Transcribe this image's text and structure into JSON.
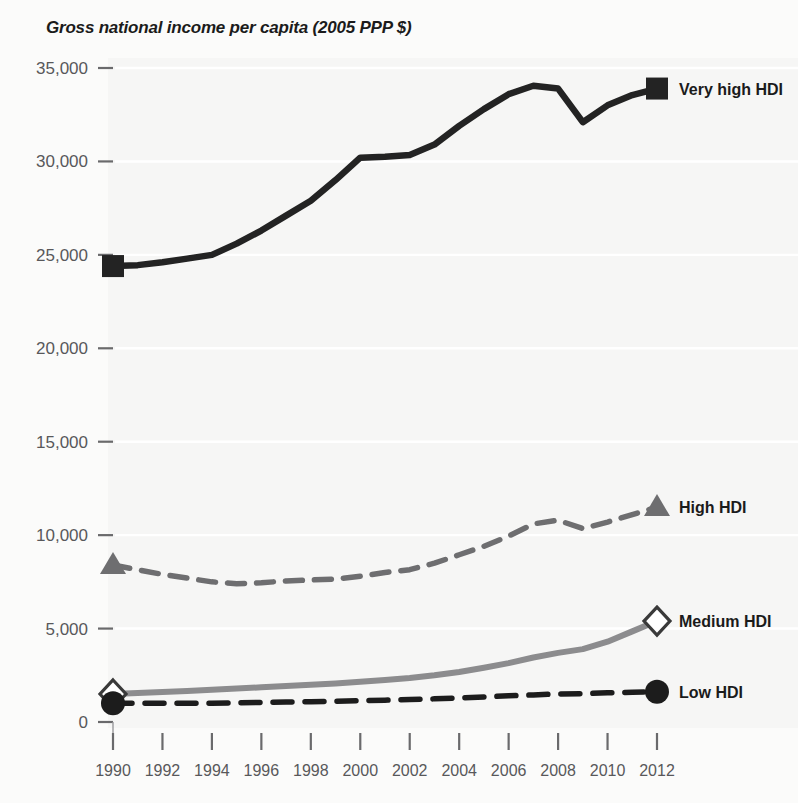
{
  "chart_data": {
    "type": "line",
    "title": "Gross national income per capita (2005 PPP $)",
    "xlabel": "",
    "ylabel": "",
    "xlim": [
      1990,
      2012
    ],
    "ylim": [
      0,
      35000
    ],
    "grid": true,
    "legend_position": "right-inline-at-series-end",
    "x": [
      1990,
      1991,
      1992,
      1993,
      1994,
      1995,
      1996,
      1997,
      1998,
      1999,
      2000,
      2001,
      2002,
      2003,
      2004,
      2005,
      2006,
      2007,
      2008,
      2009,
      2010,
      2011,
      2012
    ],
    "ytick_labels": [
      "0",
      "5,000",
      "10,000",
      "15,000",
      "20,000",
      "25,000",
      "30,000",
      "35,000"
    ],
    "ytick_values": [
      0,
      5000,
      10000,
      15000,
      20000,
      25000,
      30000,
      35000
    ],
    "xtick_labels": [
      "1990",
      "1992",
      "1994",
      "1996",
      "1998",
      "2000",
      "2002",
      "2004",
      "2006",
      "2008",
      "2010",
      "2012"
    ],
    "xtick_values": [
      1990,
      1992,
      1994,
      1996,
      1998,
      2000,
      2002,
      2004,
      2006,
      2008,
      2010,
      2012
    ],
    "series": [
      {
        "name": "Very high HDI",
        "marker": "filled-square",
        "line_style": "solid",
        "color": "#232323",
        "values": [
          24400,
          24450,
          24600,
          24800,
          25000,
          25600,
          26300,
          27100,
          27900,
          29000,
          30200,
          30250,
          30350,
          30900,
          31900,
          32800,
          33600,
          34050,
          33900,
          32100,
          33000,
          33550,
          33900
        ]
      },
      {
        "name": "High HDI",
        "marker": "filled-triangle",
        "line_style": "dashed",
        "color": "#6e6e70",
        "values": [
          8400,
          8150,
          7900,
          7700,
          7500,
          7400,
          7450,
          7550,
          7600,
          7650,
          7800,
          8000,
          8150,
          8500,
          8950,
          9400,
          9950,
          10600,
          10800,
          10350,
          10700,
          11100,
          11500
        ]
      },
      {
        "name": "Medium HDI",
        "marker": "open-diamond",
        "line_style": "solid",
        "color": "#8c8c8e",
        "values": [
          1500,
          1550,
          1600,
          1660,
          1720,
          1790,
          1860,
          1930,
          1990,
          2060,
          2150,
          2250,
          2360,
          2500,
          2680,
          2900,
          3150,
          3450,
          3700,
          3900,
          4300,
          4850,
          5400
        ]
      },
      {
        "name": "Low HDI",
        "marker": "filled-circle",
        "line_style": "dashed",
        "color": "#1c1c1c",
        "values": [
          1000,
          1000,
          1000,
          1000,
          1010,
          1030,
          1050,
          1070,
          1090,
          1110,
          1140,
          1170,
          1200,
          1240,
          1290,
          1340,
          1400,
          1450,
          1500,
          1520,
          1560,
          1590,
          1620
        ]
      }
    ]
  },
  "legend": {
    "items": [
      {
        "label": "Very high HDI"
      },
      {
        "label": "High HDI"
      },
      {
        "label": "Medium HDI"
      },
      {
        "label": "Low HDI"
      }
    ]
  },
  "colors": {
    "background": "#fbfbfa",
    "gridline": "#ffffff",
    "tick_text": "#58585a",
    "title_text": "#1b1b1b"
  }
}
